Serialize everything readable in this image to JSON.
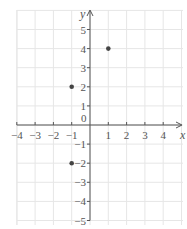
{
  "plane": {
    "x_axis_label": "x",
    "y_axis_label": "y",
    "origin_label": "0",
    "x_range": [
      -4,
      4
    ],
    "y_range": [
      -5,
      5
    ],
    "x_ticks": [
      "-4",
      "-3",
      "-2",
      "-1",
      "1",
      "2",
      "3",
      "4"
    ],
    "y_ticks": [
      "5",
      "4",
      "3",
      "2",
      "1",
      "-1",
      "-2",
      "-3",
      "-4",
      "-5"
    ],
    "grid_color": "#e6e6e6",
    "axis_color": "#555555",
    "point_color": "#444444"
  },
  "points": [
    {
      "x": 1,
      "y": 4
    },
    {
      "x": -1,
      "y": 2
    },
    {
      "x": -1,
      "y": -2
    }
  ]
}
